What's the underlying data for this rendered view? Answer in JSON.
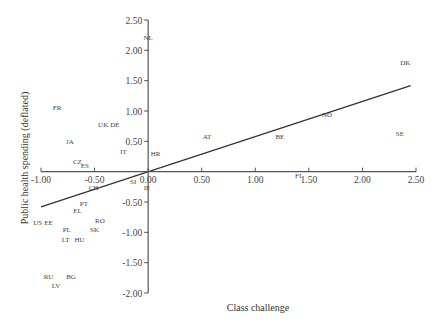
{
  "chart_data": {
    "type": "scatter",
    "title": "",
    "xlabel": "Class challenge",
    "ylabel": "Public health spending (deflated)",
    "xlim": [
      -1.0,
      2.5
    ],
    "ylim": [
      -2.0,
      2.5
    ],
    "x_ticks": [
      "-1.00",
      "-0.50",
      "0.00",
      "0.50",
      "1.00",
      "1.50",
      "2.00",
      "2.50"
    ],
    "x_tick_values": [
      -1.0,
      -0.5,
      0.0,
      0.5,
      1.0,
      1.5,
      2.0,
      2.5
    ],
    "y_ticks": [
      "2.50",
      "2.00",
      "1.50",
      "1.00",
      "0.50",
      "0.00",
      "-0.50",
      "-1.00",
      "-1.50",
      "-2.00"
    ],
    "y_tick_values": [
      2.5,
      2.0,
      1.5,
      1.0,
      0.5,
      0.0,
      -0.5,
      -1.0,
      -1.5,
      -2.0
    ],
    "grid": false,
    "legend": null,
    "axes_cross_at_origin": true,
    "points": [
      {
        "label": "NL",
        "x": 0.0,
        "y": 2.21
      },
      {
        "label": "FR",
        "x": -0.85,
        "y": 1.06
      },
      {
        "label": "UK",
        "x": -0.42,
        "y": 0.78
      },
      {
        "label": "DE",
        "x": -0.31,
        "y": 0.78
      },
      {
        "label": "JA",
        "x": -0.73,
        "y": 0.5
      },
      {
        "label": "IT",
        "x": -0.23,
        "y": 0.33
      },
      {
        "label": "HR",
        "x": 0.07,
        "y": 0.3
      },
      {
        "label": "AT",
        "x": 0.55,
        "y": 0.58
      },
      {
        "label": "BE",
        "x": 1.23,
        "y": 0.58
      },
      {
        "label": "NO",
        "x": 1.67,
        "y": 0.94
      },
      {
        "label": "DK",
        "x": 2.4,
        "y": 1.8
      },
      {
        "label": "SE",
        "x": 2.35,
        "y": 0.63
      },
      {
        "label": "FI",
        "x": 1.4,
        "y": -0.07
      },
      {
        "label": "CZ",
        "x": -0.66,
        "y": 0.17
      },
      {
        "label": "ES",
        "x": -0.59,
        "y": 0.1
      },
      {
        "label": "CH",
        "x": -0.51,
        "y": -0.26
      },
      {
        "label": "SI",
        "x": -0.14,
        "y": -0.17
      },
      {
        "label": "IE",
        "x": -0.01,
        "y": -0.26
      },
      {
        "label": "PT",
        "x": -0.6,
        "y": -0.53
      },
      {
        "label": "EL",
        "x": -0.66,
        "y": -0.64
      },
      {
        "label": "US",
        "x": -1.03,
        "y": -0.83
      },
      {
        "label": "EE",
        "x": -0.93,
        "y": -0.84
      },
      {
        "label": "RO",
        "x": -0.45,
        "y": -0.81
      },
      {
        "label": "PL",
        "x": -0.76,
        "y": -0.96
      },
      {
        "label": "SK",
        "x": -0.5,
        "y": -0.96
      },
      {
        "label": "LT",
        "x": -0.77,
        "y": -1.11
      },
      {
        "label": "HU",
        "x": -0.64,
        "y": -1.12
      },
      {
        "label": "RU",
        "x": -0.93,
        "y": -1.73
      },
      {
        "label": "BG",
        "x": -0.72,
        "y": -1.73
      },
      {
        "label": "LV",
        "x": -0.86,
        "y": -1.88
      }
    ],
    "fit_line": {
      "x": [
        -1.0,
        2.45
      ],
      "y": [
        -0.58,
        1.42
      ]
    },
    "colors": {
      "axis": "#555555",
      "text": "#444444",
      "line": "#333333",
      "background": "#ffffff"
    }
  }
}
